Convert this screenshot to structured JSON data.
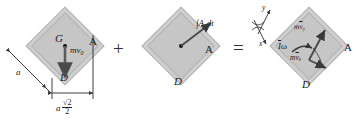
{
  "figure": {
    "operators": {
      "plus": "+",
      "equals": "="
    }
  },
  "panel_initial": {
    "name": "initial momentum diagram",
    "center_label": "G",
    "momentum_label": "mv",
    "momentum_sub": "0",
    "corner_a": "A",
    "corner_d": "D",
    "side_label": "a",
    "dimension_leader": "a",
    "dimension_num": "√2",
    "dimension_den": "2"
  },
  "panel_impulse": {
    "name": "impulse diagram",
    "impulse_integral": "∫A",
    "impulse_sub": "y",
    "impulse_dt": "dt",
    "corner_a": "A",
    "corner_d": "D"
  },
  "panel_final": {
    "name": "final momentum diagram",
    "axis_y": "y",
    "axis_x": "x",
    "momentum_y_prefix": "m",
    "momentum_y_bar": "v",
    "momentum_y_sub": "y",
    "momentum_x_prefix": "m",
    "momentum_x_bar": "v",
    "momentum_x_sub": "x",
    "angular_bar": "I",
    "angular_omega": "ω",
    "corner_a": "A",
    "corner_d": "D"
  },
  "colors": {
    "plate_fill": "#cfcfcf",
    "plate_inner_fill": "#c6c6c6",
    "plate_border": "#b0b0b0",
    "ink": "#1a1a1a",
    "arrow": "#3a3a3a"
  }
}
